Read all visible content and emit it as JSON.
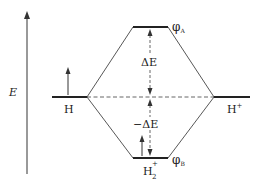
{
  "diagram": {
    "type": "molecular-orbital-energy-diagram",
    "axis": {
      "label": "E"
    },
    "levels": {
      "left_atom": {
        "label": "H"
      },
      "right_atom": {
        "label": "H",
        "label_sup": "+"
      },
      "antibonding": {
        "label": "φ",
        "label_sub": "A"
      },
      "bonding": {
        "label": "φ",
        "label_sub": "B"
      },
      "molecule": {
        "label": "H",
        "label_sub": "2",
        "label_sup": "+"
      }
    },
    "annotations": {
      "upper_gap": "ΔE",
      "lower_gap": "−ΔE"
    },
    "colors": {
      "line": "#333333",
      "level": "#222222",
      "dashed": "#555555",
      "text": "#222222"
    }
  }
}
